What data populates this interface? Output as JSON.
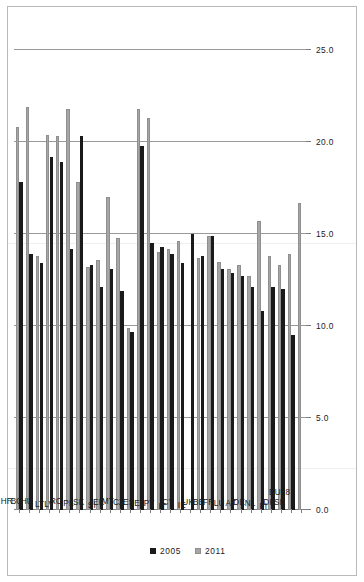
{
  "chart_data": {
    "type": "bar",
    "orientation": "horizontal",
    "title": "",
    "subtitle": "",
    "xlabel": "",
    "ylabel": "",
    "xlim": [
      0.0,
      25.0
    ],
    "xticks": [
      "0.0",
      "5.0",
      "10.0",
      "15.0",
      "20.0",
      "25.0"
    ],
    "xtick_values": [
      0.0,
      5.0,
      10.0,
      15.0,
      20.0,
      25.0
    ],
    "grid": true,
    "legend_position": "bottom-right",
    "categories": [
      "EU28",
      "SE",
      "DK",
      "FI",
      "NL",
      "DE",
      "AT",
      "LU",
      "FR",
      "BE",
      "UK",
      "IE",
      "CY",
      "IT",
      "PT",
      "EL",
      "ES",
      "CZ",
      "MT",
      "EE",
      "SI",
      "SK",
      "PL",
      "RO",
      "LV",
      "LT",
      "HU",
      "BG",
      "HR"
    ],
    "series": [
      {
        "name": "2005",
        "color": "#1a1a1a",
        "values": [
          null,
          9.5,
          12.0,
          12.1,
          10.8,
          12.1,
          12.7,
          12.9,
          13.1,
          14.9,
          13.8,
          15.0,
          13.4,
          13.9,
          14.3,
          14.5,
          19.8,
          9.7,
          11.9,
          13.1,
          12.1,
          13.3,
          20.3,
          14.2,
          18.9,
          19.2,
          13.4,
          13.9,
          17.8
        ]
      },
      {
        "name": "2011",
        "color": "#a6a6a6",
        "values": [
          16.7,
          13.9,
          13.3,
          13.8,
          15.7,
          12.7,
          13.3,
          13.1,
          13.5,
          14.9,
          13.7,
          null,
          14.6,
          14.2,
          14.0,
          21.3,
          21.8,
          9.9,
          14.8,
          17.0,
          13.6,
          13.2,
          17.8,
          21.8,
          20.3,
          20.4,
          13.8,
          21.9,
          20.8
        ]
      }
    ]
  },
  "legend": {
    "items": [
      {
        "label": "2005",
        "series": "2005"
      },
      {
        "label": "2011",
        "series": "2011"
      }
    ]
  }
}
